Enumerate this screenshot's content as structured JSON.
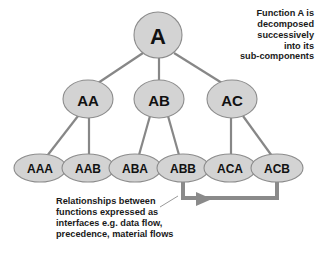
{
  "diagram": {
    "colors": {
      "node_fill": "#d3d3d3",
      "node_stroke": "#8c8c8c",
      "connector": "#878787",
      "flow_arrow": "#8a8a8a",
      "text": "#1a1a1a",
      "background": "#ffffff"
    },
    "levels": [
      {
        "level": 1,
        "nodes": [
          {
            "id": "A",
            "label": "A",
            "cx": 158,
            "cy": 35,
            "rx": 24,
            "ry": 23,
            "font_size": 22
          }
        ]
      },
      {
        "level": 2,
        "nodes": [
          {
            "id": "AA",
            "label": "AA",
            "cx": 88,
            "cy": 99,
            "rx": 25,
            "ry": 19,
            "font_size": 15
          },
          {
            "id": "AB",
            "label": "AB",
            "cx": 159,
            "cy": 99,
            "rx": 25,
            "ry": 19,
            "font_size": 15
          },
          {
            "id": "AC",
            "label": "AC",
            "cx": 232,
            "cy": 99,
            "rx": 25,
            "ry": 19,
            "font_size": 15
          }
        ]
      },
      {
        "level": 3,
        "nodes": [
          {
            "id": "AAA",
            "label": "AAA",
            "cx": 40,
            "cy": 168,
            "rx": 26,
            "ry": 14,
            "font_size": 12
          },
          {
            "id": "AAB",
            "label": "AAB",
            "cx": 88,
            "cy": 168,
            "rx": 26,
            "ry": 14,
            "font_size": 12
          },
          {
            "id": "ABA",
            "label": "ABA",
            "cx": 135,
            "cy": 168,
            "rx": 26,
            "ry": 14,
            "font_size": 12
          },
          {
            "id": "ABB",
            "label": "ABB",
            "cx": 183,
            "cy": 168,
            "rx": 26,
            "ry": 14,
            "font_size": 12
          },
          {
            "id": "ACA",
            "label": "ACA",
            "cx": 230,
            "cy": 168,
            "rx": 26,
            "ry": 14,
            "font_size": 12
          },
          {
            "id": "ACB",
            "label": "ACB",
            "cx": 277,
            "cy": 168,
            "rx": 26,
            "ry": 14,
            "font_size": 12
          }
        ]
      }
    ],
    "edges": [
      {
        "from": "A",
        "to": "AA",
        "x1": 143,
        "y1": 53,
        "x2": 98,
        "y2": 83
      },
      {
        "from": "A",
        "to": "AB",
        "x1": 159,
        "y1": 58,
        "x2": 159,
        "y2": 80
      },
      {
        "from": "A",
        "to": "AC",
        "x1": 174,
        "y1": 53,
        "x2": 222,
        "y2": 83
      },
      {
        "from": "AA",
        "to": "AAA",
        "x1": 78,
        "y1": 116,
        "x2": 47,
        "y2": 156
      },
      {
        "from": "AA",
        "to": "AAB",
        "x1": 89,
        "y1": 118,
        "x2": 89,
        "y2": 155
      },
      {
        "from": "AB",
        "to": "ABA",
        "x1": 150,
        "y1": 116,
        "x2": 139,
        "y2": 155
      },
      {
        "from": "AB",
        "to": "ABB",
        "x1": 168,
        "y1": 116,
        "x2": 179,
        "y2": 155
      },
      {
        "from": "AC",
        "to": "ACA",
        "x1": 231,
        "y1": 118,
        "x2": 231,
        "y2": 155
      },
      {
        "from": "AC",
        "to": "ACB",
        "x1": 243,
        "y1": 116,
        "x2": 272,
        "y2": 156
      }
    ],
    "flow_connection": {
      "from": "ABB",
      "to": "ACB",
      "description": "interface flow between ABB and ACB",
      "path": "M 183 182 L 183 198 L 277 198 L 277 182",
      "arrow_head_points": "196,192 212,199 196,206"
    },
    "leader_line": {
      "description": "leader from bottom annotation to flow arrow",
      "path": "M 160 207 L 178 196"
    }
  },
  "annotations": {
    "top_right": "Function A is\ndecomposed\nsuccessively\ninto its\nsub-components",
    "bottom_left": "Relationships between\nfunctions expressed as\ninterfaces e.g. data flow,\nprecedence, material flows"
  }
}
